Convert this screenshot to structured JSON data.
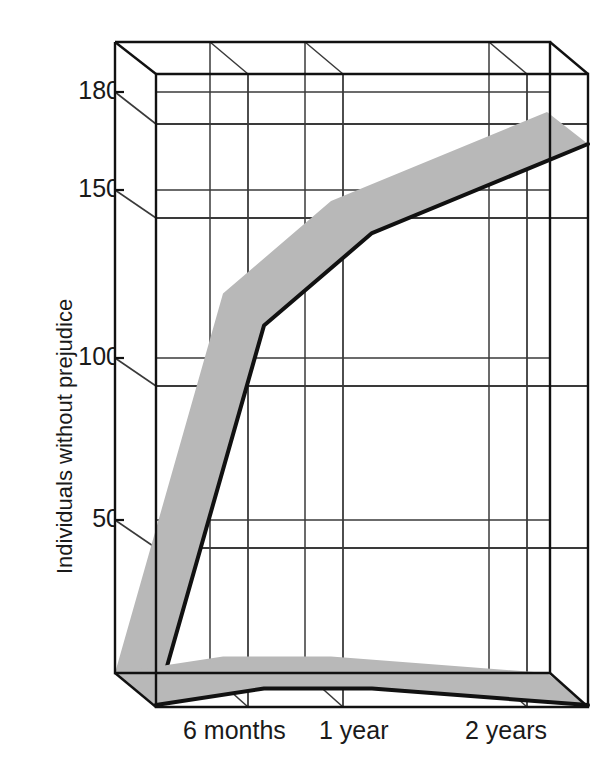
{
  "chart_data": {
    "type": "area",
    "title": "",
    "subtitle": "",
    "xlabel": "",
    "ylabel": "Individuals without prejudice",
    "x": [
      0,
      0.5,
      1,
      2
    ],
    "categories": [
      "",
      "6 months",
      "1 year",
      "2 years"
    ],
    "xticklabels": [
      "6 months",
      "1 year",
      "2 years"
    ],
    "yticks": [
      50,
      100,
      150,
      180
    ],
    "yticklabels": [
      "50",
      "100",
      "150",
      "180"
    ],
    "ylim": [
      0,
      190
    ],
    "xlim": [
      0,
      2
    ],
    "grid": true,
    "legend_position": "inline-annotations",
    "projection": "3d-ribbon",
    "series": [
      {
        "name": "Treatment group",
        "values": [
          0,
          115,
          143,
          170
        ],
        "color": "#111111",
        "band_color": "#b8b8b8"
      },
      {
        "name": "Control group",
        "values": [
          0,
          5,
          5,
          0
        ],
        "color": "#111111",
        "band_color": "#b8b8b8"
      }
    ],
    "annotations": [
      {
        "text": "Treatment group",
        "x_px": 215,
        "y_px": 126
      },
      {
        "text": "Control group",
        "x_px": 362,
        "y_px": 636
      }
    ]
  },
  "axes": {
    "y_axis_title": "Individuals without prejudice",
    "y_ticks": [
      {
        "label": "180",
        "value": 180
      },
      {
        "label": "150",
        "value": 150
      },
      {
        "label": "100",
        "value": 100
      },
      {
        "label": "50",
        "value": 50
      }
    ],
    "x_ticks": [
      {
        "label": "6 months",
        "value": 0.5
      },
      {
        "label": "1 year",
        "value": 1
      },
      {
        "label": "2 years",
        "value": 2
      }
    ]
  },
  "colors": {
    "line": "#111111",
    "band": "#b8b8b8",
    "grid": "#3a3a3a",
    "frame": "#111111",
    "background": "#ffffff",
    "text": "#1a1a1a"
  }
}
